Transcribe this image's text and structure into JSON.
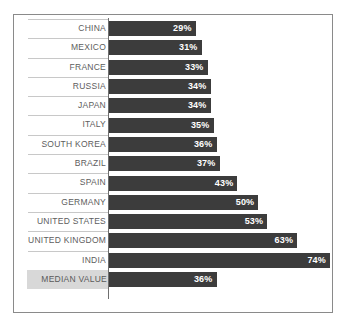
{
  "chart_data": {
    "type": "bar",
    "orientation": "horizontal",
    "title": "",
    "subtitle": "",
    "xlabel": "",
    "ylabel": "",
    "xlim": [
      0,
      74
    ],
    "grid": false,
    "legend": false,
    "value_suffix": "%",
    "categories": [
      "CHINA",
      "MEXICO",
      "FRANCE",
      "RUSSIA",
      "JAPAN",
      "ITALY",
      "SOUTH KOREA",
      "BRAZIL",
      "SPAIN",
      "GERMANY",
      "UNITED STATES",
      "UNITED KINGDOM",
      "INDIA",
      "MEDIAN VALUE"
    ],
    "values": [
      29,
      31,
      33,
      34,
      34,
      35,
      36,
      37,
      43,
      50,
      53,
      63,
      74,
      36
    ],
    "labels": [
      "29%",
      "31%",
      "33%",
      "34%",
      "34%",
      "35%",
      "36%",
      "37%",
      "43%",
      "50%",
      "53%",
      "63%",
      "74%",
      "36%"
    ],
    "colors": {
      "bar": "#3c3c3c",
      "bar_label_text": "#ffffff",
      "category_label_text": "#5d5d5d",
      "median_row_background": "#d8d8d8",
      "axis_line": "#6f6f6f",
      "row_separator": "#c8c8c8",
      "frame_border": "#8a8a8a",
      "background": "#ffffff"
    }
  },
  "rows": [
    {
      "label": "CHINA",
      "value": 29,
      "value_label": "29%",
      "median": false
    },
    {
      "label": "MEXICO",
      "value": 31,
      "value_label": "31%",
      "median": false
    },
    {
      "label": "FRANCE",
      "value": 33,
      "value_label": "33%",
      "median": false
    },
    {
      "label": "RUSSIA",
      "value": 34,
      "value_label": "34%",
      "median": false
    },
    {
      "label": "JAPAN",
      "value": 34,
      "value_label": "34%",
      "median": false
    },
    {
      "label": "ITALY",
      "value": 35,
      "value_label": "35%",
      "median": false
    },
    {
      "label": "SOUTH KOREA",
      "value": 36,
      "value_label": "36%",
      "median": false
    },
    {
      "label": "BRAZIL",
      "value": 37,
      "value_label": "37%",
      "median": false
    },
    {
      "label": "SPAIN",
      "value": 43,
      "value_label": "43%",
      "median": false
    },
    {
      "label": "GERMANY",
      "value": 50,
      "value_label": "50%",
      "median": false
    },
    {
      "label": "UNITED STATES",
      "value": 53,
      "value_label": "53%",
      "median": false
    },
    {
      "label": "UNITED KINGDOM",
      "value": 63,
      "value_label": "63%",
      "median": false
    },
    {
      "label": "INDIA",
      "value": 74,
      "value_label": "74%",
      "median": false
    },
    {
      "label": "MEDIAN VALUE",
      "value": 36,
      "value_label": "36%",
      "median": true
    }
  ]
}
